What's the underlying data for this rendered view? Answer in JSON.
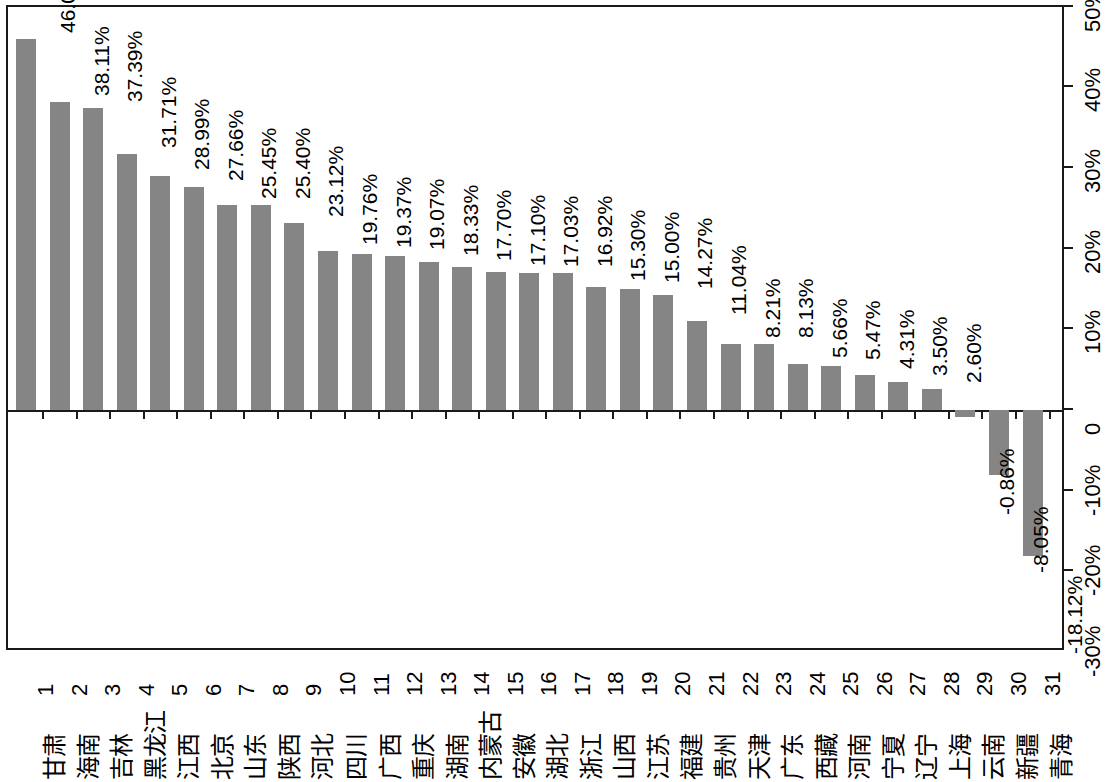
{
  "chart_data": {
    "type": "bar",
    "title": "",
    "subtitle": "",
    "xlabel": "",
    "ylabel": "",
    "orientation": "vertical-bars-on-rotated-page",
    "grid": false,
    "legend": null,
    "value_format": "percent",
    "ylim": [
      -30,
      50
    ],
    "ytick_labels": [
      "50%",
      "40%",
      "30%",
      "20%",
      "10%",
      "0",
      "-10%",
      "-20%",
      "-30%"
    ],
    "ytick_values": [
      50,
      40,
      30,
      20,
      10,
      0,
      -10,
      -20,
      -30
    ],
    "ytick_interval": 10,
    "ranks": [
      1,
      2,
      3,
      4,
      5,
      6,
      7,
      8,
      9,
      10,
      11,
      12,
      13,
      14,
      15,
      16,
      17,
      18,
      19,
      20,
      21,
      22,
      23,
      24,
      25,
      26,
      27,
      28,
      29,
      30,
      31
    ],
    "categories": [
      "甘肃",
      "海南",
      "吉林",
      "黑龙江",
      "江西",
      "北京",
      "山东",
      "陕西",
      "河北",
      "四川",
      "广西",
      "重庆",
      "湖南",
      "内蒙古",
      "安徽",
      "湖北",
      "浙江",
      "山西",
      "江苏",
      "福建",
      "贵州",
      "天津",
      "广东",
      "西藏",
      "河南",
      "宁夏",
      "辽宁",
      "上海",
      "云南",
      "新疆",
      "青海"
    ],
    "values": [
      46.01,
      38.11,
      37.39,
      31.71,
      28.99,
      27.66,
      25.45,
      25.4,
      23.12,
      19.76,
      19.37,
      19.07,
      18.33,
      17.7,
      17.1,
      17.03,
      16.92,
      15.3,
      15.0,
      14.27,
      11.04,
      8.21,
      8.13,
      5.66,
      5.47,
      4.31,
      3.5,
      2.6,
      -0.86,
      -8.05,
      -18.12
    ],
    "data_labels": [
      "46.01%",
      "38.11%",
      "37.39%",
      "31.71%",
      "28.99%",
      "27.66%",
      "25.45%",
      "25.40%",
      "23.12%",
      "19.76%",
      "19.37%",
      "19.07%",
      "18.33%",
      "17.70%",
      "17.10%",
      "17.03%",
      "16.92%",
      "15.30%",
      "15.00%",
      "14.27%",
      "11.04%",
      "8.21%",
      "8.13%",
      "5.66%",
      "5.47%",
      "4.31%",
      "3.50%",
      "2.60%",
      "-0.86%",
      "-8.05%",
      "-18.12%"
    ],
    "bar_color": "#858585",
    "axis_color": "#1a1a1a",
    "background_color": "#ffffff"
  }
}
